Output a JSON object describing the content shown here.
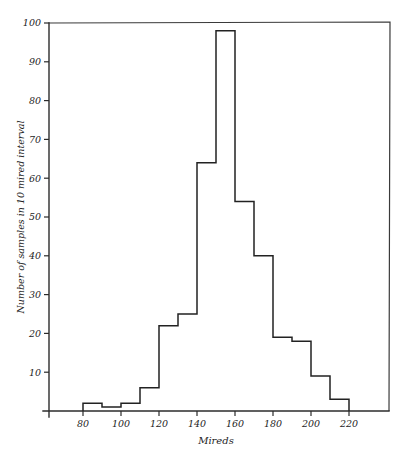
{
  "chart_data": {
    "type": "bar",
    "title": "",
    "subtitle": "",
    "xlabel": "Mireds",
    "ylabel": "Number of samples in 10 mired interval",
    "bin_width": 10,
    "bin_edges": [
      80,
      90,
      100,
      110,
      120,
      130,
      140,
      150,
      160,
      170,
      180,
      190,
      200,
      210,
      220
    ],
    "categories": [
      "80-90",
      "90-100",
      "100-110",
      "110-120",
      "120-130",
      "130-140",
      "140-150",
      "150-160",
      "160-170",
      "170-180",
      "180-190",
      "190-200",
      "200-210",
      "210-220"
    ],
    "values": [
      2,
      1,
      2,
      6,
      22,
      25,
      64,
      98,
      54,
      40,
      19,
      18,
      9,
      3
    ],
    "xlim": [
      60,
      240
    ],
    "ylim": [
      0,
      102
    ],
    "xticks": [
      80,
      100,
      120,
      140,
      160,
      180,
      200,
      220
    ],
    "xtick_labels": [
      "80",
      "100",
      "120",
      "140",
      "160",
      "180",
      "200",
      "220"
    ],
    "yticks": [
      10,
      20,
      30,
      40,
      50,
      60,
      70,
      80,
      90,
      100
    ],
    "ytick_labels": [
      "10",
      "20",
      "30",
      "40",
      "50",
      "60",
      "70",
      "80",
      "90",
      "100"
    ],
    "grid": false,
    "legend": false,
    "legend_position": "none",
    "line_color": "#222222",
    "axis_color": "#2b2b2b",
    "background_color": "#ffffff"
  },
  "axes": {
    "x_label": "Mireds",
    "y_label": "Number of samples in 10 mired interval"
  }
}
